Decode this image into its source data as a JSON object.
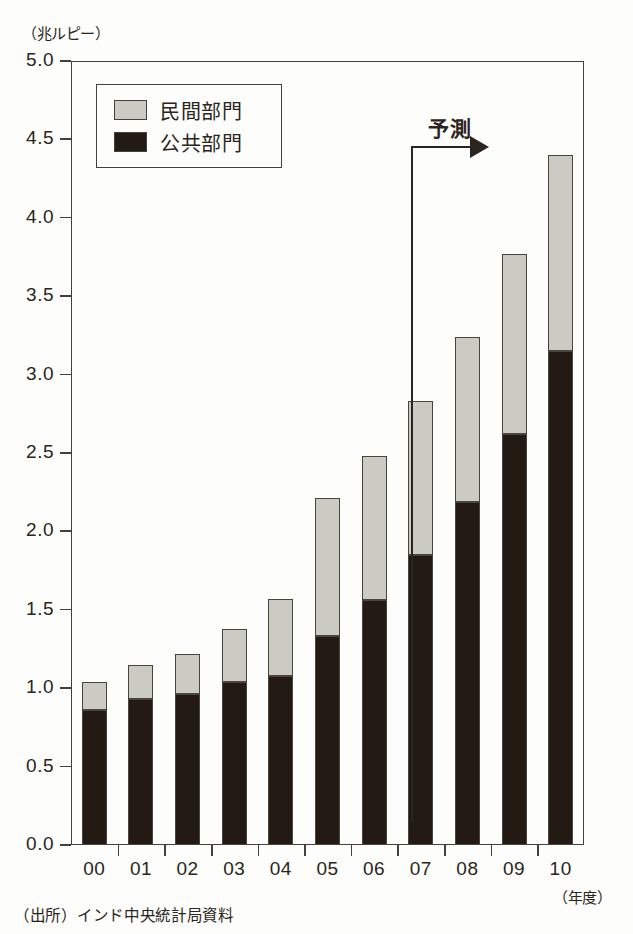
{
  "chart_data": {
    "type": "bar",
    "subtype": "stacked-vertical",
    "title": "",
    "unit_label": "（兆ルピー）",
    "xlabel": "（年度）",
    "ylabel": "",
    "categories": [
      "00",
      "01",
      "02",
      "03",
      "04",
      "05",
      "06",
      "07",
      "08",
      "09",
      "10"
    ],
    "series": [
      {
        "name": "公共部門",
        "color": "#231a14",
        "values": [
          0.86,
          0.93,
          0.96,
          1.04,
          1.08,
          1.33,
          1.56,
          1.85,
          2.19,
          2.62,
          3.15
        ]
      },
      {
        "name": "民間部門",
        "color": "#cbcac3",
        "values": [
          0.18,
          0.22,
          0.26,
          0.34,
          0.49,
          0.88,
          0.92,
          0.98,
          1.05,
          1.15,
          1.25
        ]
      }
    ],
    "totals": [
      1.04,
      1.15,
      1.22,
      1.38,
      1.57,
      2.21,
      2.48,
      2.83,
      3.24,
      3.77,
      4.4
    ],
    "ylim": [
      0.0,
      5.0
    ],
    "ytick_values": [
      0.0,
      0.5,
      1.0,
      1.5,
      2.0,
      2.5,
      3.0,
      3.5,
      4.0,
      4.5,
      5.0
    ],
    "ytick_labels": [
      "0.0",
      "0.5",
      "1.0",
      "1.5",
      "2.0",
      "2.5",
      "3.0",
      "3.5",
      "4.0",
      "4.5",
      "5.0"
    ],
    "grid": false,
    "legend_position": "top-left",
    "annotations": [
      {
        "text": "予測",
        "kind": "forecast-bracket-arrow",
        "starts_between_categories": [
          "06",
          "07"
        ],
        "points_to": "10"
      }
    ],
    "stack_order_bottom_to_top": [
      "公共部門",
      "民間部門"
    ]
  },
  "legend": {
    "items": [
      {
        "label": "民間部門",
        "swatch": "light-gray"
      },
      {
        "label": "公共部門",
        "swatch": "black"
      }
    ]
  },
  "axes": {
    "y_unit_caption": "（兆ルピー）",
    "x_unit_caption": "（年度）"
  },
  "forecast": {
    "label": "予測"
  },
  "footer": {
    "source": "（出所）インド中央統計局資料"
  }
}
